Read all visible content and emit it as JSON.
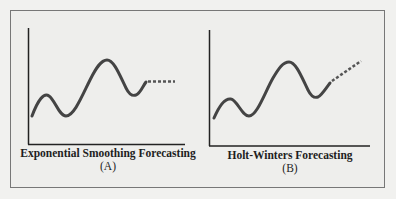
{
  "figure": {
    "panels": [
      {
        "title": "Exponential Smoothing Forecasting",
        "label": "(A)",
        "forecast_style": "flat dashed continuation"
      },
      {
        "title": "Holt-Winters Forecasting",
        "label": "(B)",
        "forecast_style": "upward-trending dashed continuation"
      }
    ],
    "colors": {
      "line": "#444444",
      "axis": "#222222",
      "frame": "#777777",
      "background": "#eeeeec"
    }
  }
}
